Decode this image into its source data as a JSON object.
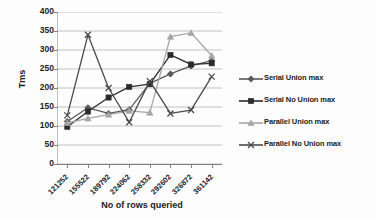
{
  "chart_data": {
    "type": "line",
    "title": "",
    "xlabel": "No of rows queried",
    "ylabel": "Tms",
    "ylim": [
      0,
      400
    ],
    "yticks": [
      0,
      50,
      100,
      150,
      200,
      250,
      300,
      350,
      400
    ],
    "grid": true,
    "legend_position": "right",
    "categories": [
      "121252",
      "155522",
      "189792",
      "224062",
      "258332",
      "292602",
      "326872",
      "361142"
    ],
    "series": [
      {
        "name": "Serial Union max",
        "marker": "diamond",
        "color": "#595959",
        "values": [
          112,
          148,
          133,
          143,
          212,
          237,
          258,
          272
        ]
      },
      {
        "name": "Serial No Union max",
        "marker": "square",
        "color": "#2b2b2b",
        "values": [
          98,
          138,
          175,
          203,
          210,
          287,
          262,
          265
        ]
      },
      {
        "name": "Parallel Union max",
        "marker": "triangle",
        "color": "#a6a6a6",
        "values": [
          108,
          120,
          130,
          140,
          135,
          335,
          345,
          285
        ]
      },
      {
        "name": "Parallel No Union max",
        "marker": "x",
        "color": "#4a4a4a",
        "values": [
          128,
          340,
          200,
          110,
          218,
          133,
          142,
          230
        ]
      }
    ]
  },
  "axis": {
    "y_label": "Tms",
    "x_label": "No of rows queried"
  },
  "legend": {
    "items": [
      {
        "label": "Serial Union max"
      },
      {
        "label": "Serial No Union max"
      },
      {
        "label": "Parallel Union max"
      },
      {
        "label": "Parallel No Union max"
      }
    ]
  }
}
